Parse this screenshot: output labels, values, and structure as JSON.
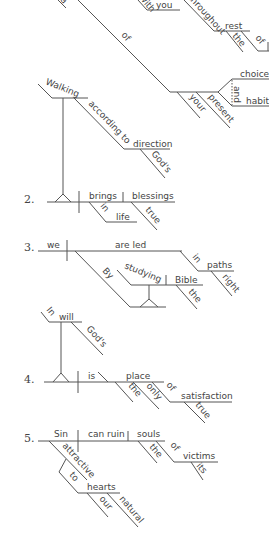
{
  "diagrams": {
    "d1": {
      "words": {
        "top_left": "a",
        "with": "with",
        "you": "you",
        "throughout": "throughout",
        "rest": "rest",
        "the": "the",
        "of2": "of",
        "of": "of",
        "choices": "choices",
        "and": "and",
        "habits": "habits",
        "your": "your",
        "present": "present",
        "walking": "Walking",
        "according_to": "according to",
        "direction": "direction",
        "gods": "God's"
      }
    },
    "d2": {
      "number": "2.",
      "words": {
        "brings": "brings",
        "blessings": "blessings",
        "in": "in",
        "life": "life",
        "true": "true"
      }
    },
    "d3": {
      "number": "3.",
      "words": {
        "we": "we",
        "are_led": "are led",
        "in": "in",
        "paths": "paths",
        "right": "right",
        "by": "By",
        "studying": "studying",
        "bible": "Bible",
        "the": "the"
      }
    },
    "d4": {
      "number": "4.",
      "words": {
        "in": "In",
        "will": "will",
        "gods": "God's",
        "is": "is",
        "place": "place",
        "the": "the",
        "only": "only",
        "of": "of",
        "satisfaction": "satisfaction",
        "true": "true"
      }
    },
    "d5": {
      "number": "5.",
      "words": {
        "sin": "Sin",
        "can_ruin": "can ruin",
        "souls": "souls",
        "the": "the",
        "of": "of",
        "victims": "victims",
        "its": "its",
        "attractive": "attractive",
        "to": "to",
        "hearts": "hearts",
        "our": "our",
        "natural": "natural"
      }
    }
  }
}
